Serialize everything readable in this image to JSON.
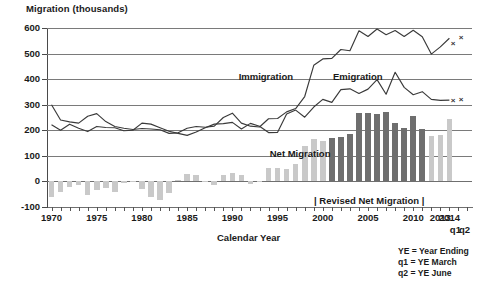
{
  "title": "Migration (thousands)",
  "axes": {
    "xlabel": "Calendar Year",
    "ylabel": "Migration (thousands)",
    "yticks": [
      "600",
      "500",
      "400",
      "300",
      "200",
      "100",
      "0",
      "-100"
    ],
    "xticks": [
      "1970",
      "1975",
      "1980",
      "1985",
      "1990",
      "1995",
      "2000",
      "2005",
      "2010",
      "2013",
      "2014"
    ],
    "q_labels": [
      "q1",
      "q2"
    ]
  },
  "labels": {
    "immigration": "Immigration",
    "emigration": "Emigration",
    "net_migration": "Net Migration",
    "revised": "| Revised Net Migration |"
  },
  "notes": {
    "line1": "YE = Year Ending",
    "line2": "q1 = YE March",
    "line3": "q2 = YE June"
  },
  "colors": {
    "line": "#3a3a3a",
    "grid": "#7a7a7a",
    "bar_light": "#c9c9c9",
    "bar_dark": "#6e6e6e",
    "text": "#1a1a1a"
  },
  "chart_data": {
    "type": "line",
    "title": "Migration (thousands)",
    "xlabel": "Calendar Year",
    "ylabel": "Migration (thousands)",
    "ylim": [
      -100,
      600
    ],
    "grid": true,
    "legend": "inline-annotations",
    "x": [
      1970,
      1971,
      1972,
      1973,
      1974,
      1975,
      1976,
      1977,
      1978,
      1979,
      1980,
      1981,
      1982,
      1983,
      1984,
      1985,
      1986,
      1987,
      1988,
      1989,
      1990,
      1991,
      1992,
      1993,
      1994,
      1995,
      1996,
      1997,
      1998,
      1999,
      2000,
      2001,
      2002,
      2003,
      2004,
      2005,
      2006,
      2007,
      2008,
      2009,
      2010,
      2011,
      2012,
      2013,
      2014
    ],
    "series": [
      {
        "name": "Immigration",
        "type": "line",
        "values": [
          300,
          240,
          233,
          228,
          255,
          265,
          234,
          215,
          208,
          203,
          207,
          205,
          202,
          188,
          190,
          208,
          215,
          212,
          216,
          250,
          267,
          228,
          216,
          213,
          245,
          246,
          272,
          285,
          332,
          454,
          479,
          481,
          516,
          511,
          589,
          567,
          596,
          574,
          590,
          567,
          591,
          566,
          498,
          526,
          560
        ]
      },
      {
        "name": "Emigration",
        "type": "line",
        "values": [
          222,
          200,
          224,
          208,
          195,
          215,
          211,
          210,
          198,
          200,
          228,
          224,
          210,
          196,
          188,
          180,
          193,
          210,
          224,
          226,
          231,
          205,
          227,
          216,
          191,
          192,
          264,
          279,
          251,
          291,
          321,
          309,
          359,
          362,
          344,
          361,
          398,
          341,
          427,
          368,
          339,
          351,
          321,
          317,
          318
        ]
      },
      {
        "name": "Net Migration",
        "type": "bar",
        "style_note": "light gray bars 1970-2000 and 2012-2014; dark gray 'Revised Net Migration' bars 2001-2011",
        "values": [
          -60,
          -40,
          -20,
          -15,
          -55,
          -35,
          -25,
          -40,
          -5,
          -3,
          -28,
          -62,
          -72,
          -45,
          5,
          30,
          25,
          2,
          -15,
          25,
          32,
          25,
          -12,
          -3,
          53,
          51,
          47,
          70,
          140,
          165,
          158,
          171,
          172,
          185,
          268,
          267,
          265,
          273,
          229,
          210,
          256,
          205,
          177,
          183,
          243
        ],
        "revised_start_year": 2001,
        "revised_end_year": 2011
      }
    ],
    "markers": [
      {
        "label": "x",
        "series": "Immigration",
        "x": "2013 q1",
        "value": 540
      },
      {
        "label": "x",
        "series": "Immigration",
        "x": "2014 q2",
        "value": 560
      },
      {
        "label": "x",
        "series": "Emigration",
        "x": "2013 q1",
        "value": 317
      },
      {
        "label": "x",
        "series": "Emigration",
        "x": "2014 q2",
        "value": 320
      }
    ],
    "annotations": [
      {
        "text": "Immigration",
        "x": 1996,
        "y": 420
      },
      {
        "text": "Emigration",
        "x": 2004,
        "y": 420
      },
      {
        "text": "Net Migration",
        "x": 1999,
        "y": 105
      },
      {
        "text": "| Revised Net Migration |",
        "x": 2006,
        "y": -75
      }
    ]
  }
}
